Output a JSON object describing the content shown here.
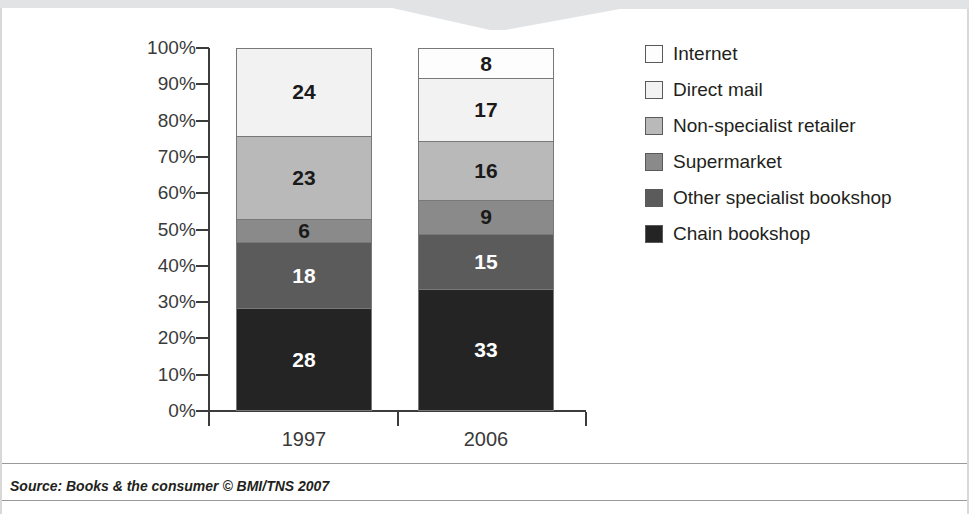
{
  "chart_data": {
    "type": "bar",
    "variant": "stacked-100-percent",
    "title": "",
    "xlabel": "",
    "ylabel": "",
    "categories": [
      "1997",
      "2006"
    ],
    "ylim": [
      0,
      100
    ],
    "ytick_labels": [
      "0%",
      "10%",
      "20%",
      "30%",
      "40%",
      "50%",
      "60%",
      "70%",
      "80%",
      "90%",
      "100%"
    ],
    "ytick_values": [
      0,
      10,
      20,
      30,
      40,
      50,
      60,
      70,
      80,
      90,
      100
    ],
    "grid": false,
    "legend_position": "right",
    "series": [
      {
        "name": "Internet",
        "color": "#fdfdfd",
        "values": [
          0,
          8
        ],
        "labels": [
          "",
          "8"
        ]
      },
      {
        "name": "Direct mail",
        "color": "#f2f2f2",
        "values": [
          24,
          17
        ],
        "labels": [
          "24",
          "17"
        ]
      },
      {
        "name": "Non-specialist retailer",
        "color": "#b9b9b9",
        "values": [
          23,
          16
        ],
        "labels": [
          "23",
          "16"
        ]
      },
      {
        "name": "Supermarket",
        "color": "#8a8a8a",
        "values": [
          6,
          9
        ],
        "labels": [
          "6",
          "9"
        ]
      },
      {
        "name": "Other specialist bookshop",
        "color": "#5b5b5b",
        "values": [
          18,
          15
        ],
        "labels": [
          "18",
          "15"
        ]
      },
      {
        "name": "Chain bookshop",
        "color": "#242424",
        "values": [
          28,
          33
        ],
        "labels": [
          "28",
          "33"
        ]
      }
    ]
  },
  "legend": {
    "items": [
      {
        "label": "Internet",
        "color": "#fdfdfd"
      },
      {
        "label": "Direct mail",
        "color": "#f2f2f2"
      },
      {
        "label": "Non-specialist retailer",
        "color": "#b9b9b9"
      },
      {
        "label": "Supermarket",
        "color": "#8a8a8a"
      },
      {
        "label": "Other specialist bookshop",
        "color": "#5b5b5b"
      },
      {
        "label": "Chain bookshop",
        "color": "#242424"
      }
    ]
  },
  "footer": {
    "source": "Source: Books & the consumer © BMI/TNS 2007"
  }
}
